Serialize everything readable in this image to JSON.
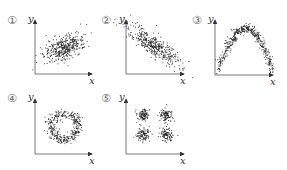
{
  "chart_data": [
    {
      "type": "scatter",
      "label": "①",
      "pattern": "positive linear correlation (ellipse, rising)",
      "xlabel": "x",
      "ylabel": "y"
    },
    {
      "type": "scatter",
      "label": "②",
      "pattern": "negative linear correlation (elongated, falling)",
      "xlabel": "x",
      "ylabel": "y"
    },
    {
      "type": "scatter",
      "label": "③",
      "pattern": "inverted parabola (arch)",
      "xlabel": "x",
      "ylabel": "y"
    },
    {
      "type": "scatter",
      "label": "④",
      "pattern": "ring / circle",
      "xlabel": "x",
      "ylabel": "y"
    },
    {
      "type": "scatter",
      "label": "⑤",
      "pattern": "four clusters in 2x2 grid",
      "xlabel": "x",
      "ylabel": "y"
    }
  ],
  "panels": [
    {
      "num": "①",
      "x": "x",
      "y": "y"
    },
    {
      "num": "②",
      "x": "x",
      "y": "y"
    },
    {
      "num": "③",
      "x": "x",
      "y": "y"
    },
    {
      "num": "④",
      "x": "x",
      "y": "y"
    },
    {
      "num": "⑤",
      "x": "x",
      "y": "y"
    }
  ]
}
